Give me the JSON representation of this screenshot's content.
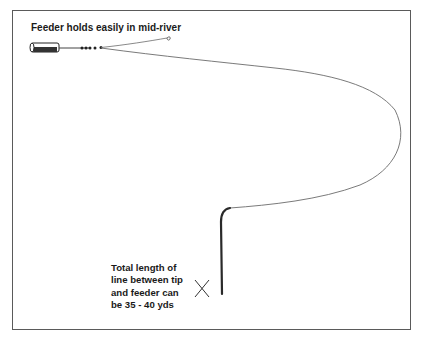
{
  "diagram": {
    "title": "Feeder holds easily in mid-river",
    "note_lines": [
      "Total length of",
      "line between tip",
      "and feeder can",
      "be 35 - 40 yds"
    ],
    "marker": "X",
    "colors": {
      "line": "#6b6b6b",
      "rod": "#2a2a2a",
      "text": "#1a1a1a",
      "frame": "#5a5a5a"
    }
  }
}
